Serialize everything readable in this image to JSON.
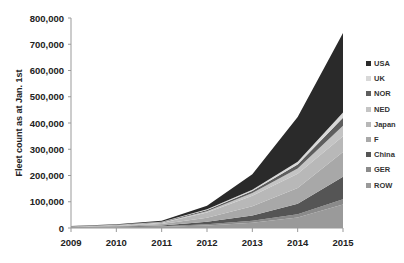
{
  "chart_data": {
    "type": "area",
    "stacked": true,
    "title": "",
    "xlabel": "",
    "ylabel": "Fleet count as at Jan. 1st",
    "ylim": [
      0,
      800000
    ],
    "yticks": [
      "0",
      "100,000",
      "200,000",
      "300,000",
      "400,000",
      "500,000",
      "600,000",
      "700,000",
      "800,000"
    ],
    "categories": [
      "2009",
      "2010",
      "2011",
      "2012",
      "2013",
      "2014",
      "2015"
    ],
    "grid": false,
    "legend_position": "right",
    "series": [
      {
        "name": "ROW",
        "color": "#9a9a9a",
        "values": [
          2000,
          3000,
          5000,
          10000,
          20000,
          40000,
          90000
        ]
      },
      {
        "name": "GER",
        "color": "#8a8a8a",
        "values": [
          500,
          1000,
          2000,
          4000,
          8000,
          12000,
          20000
        ]
      },
      {
        "name": "China",
        "color": "#555555",
        "values": [
          1000,
          1500,
          3000,
          10000,
          20000,
          40000,
          85000
        ]
      },
      {
        "name": "F",
        "color": "#a8a8a8",
        "values": [
          1000,
          2000,
          5000,
          15000,
          35000,
          60000,
          95000
        ]
      },
      {
        "name": "Japan",
        "color": "#b8b8b8",
        "values": [
          1000,
          2000,
          4000,
          20000,
          40000,
          55000,
          60000
        ]
      },
      {
        "name": "NED",
        "color": "#c4c4c4",
        "values": [
          500,
          1000,
          2000,
          5000,
          10000,
          20000,
          40000
        ]
      },
      {
        "name": "NOR",
        "color": "#5e5e5e",
        "values": [
          500,
          1000,
          2000,
          5000,
          8000,
          15000,
          30000
        ]
      },
      {
        "name": "UK",
        "color": "#d8d8d8",
        "values": [
          500,
          500,
          1000,
          2000,
          5000,
          10000,
          20000
        ]
      },
      {
        "name": "USA",
        "color": "#2a2a2a",
        "values": [
          1000,
          2000,
          4000,
          14000,
          59000,
          171000,
          303000
        ]
      }
    ],
    "legend_order": [
      "USA",
      "UK",
      "NOR",
      "NED",
      "Japan",
      "F",
      "China",
      "GER",
      "ROW"
    ]
  }
}
